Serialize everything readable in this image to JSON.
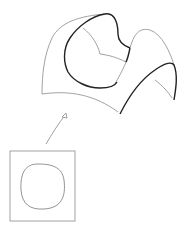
{
  "diagram": {
    "colors": {
      "background": "#ffffff",
      "thin_line": "#8a8a8a",
      "thick_line": "#222222",
      "domain_curve": "#777777"
    },
    "elements": [
      {
        "name": "surface-patch",
        "kind": "3D surface outline"
      },
      {
        "name": "surface-boundary-curve",
        "kind": "bold closed curve on surface"
      },
      {
        "name": "mapping-arrow",
        "kind": "curved arrow from domain to surface"
      },
      {
        "name": "parameter-domain",
        "kind": "square with rounded closed curve"
      }
    ]
  }
}
